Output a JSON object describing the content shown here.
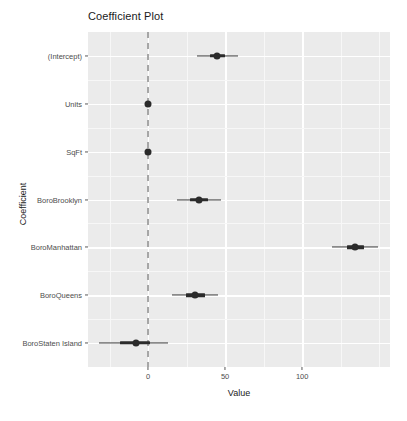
{
  "chart_data": {
    "type": "scatter",
    "title": "Coefficient Plot",
    "xlabel": "Value",
    "ylabel": "Coefficient",
    "xlim": [
      -39,
      157
    ],
    "grid": true,
    "legend": null,
    "xticks": [
      {
        "value": 0,
        "label": "0"
      },
      {
        "value": 50,
        "label": "50"
      },
      {
        "value": 100,
        "label": "100"
      }
    ],
    "x_minor_ticks": [
      -25,
      25,
      75,
      125,
      150
    ],
    "reference_line": {
      "value": 0,
      "style": "dashed",
      "color": "#a6a6a6"
    },
    "categories": [
      "BoroStaten Island",
      "BoroQueens",
      "BoroManhattan",
      "BoroBrooklyn",
      "SqFt",
      "Units",
      "(Intercept)"
    ],
    "points": [
      {
        "label": "BoroStaten Island",
        "estimate": -8.0,
        "inner_low": -18.0,
        "inner_high": 1.5,
        "outer_low": -32.0,
        "outer_high": 13.0
      },
      {
        "label": "BoroQueens",
        "estimate": 30.5,
        "inner_low": 24.5,
        "inner_high": 37.0,
        "outer_low": 15.5,
        "outer_high": 45.5
      },
      {
        "label": "BoroManhattan",
        "estimate": 134.5,
        "inner_low": 129.0,
        "inner_high": 140.0,
        "outer_low": 119.5,
        "outer_high": 149.0
      },
      {
        "label": "BoroBrooklyn",
        "estimate": 33.0,
        "inner_low": 27.5,
        "inner_high": 39.0,
        "outer_low": 18.5,
        "outer_high": 47.5
      },
      {
        "label": "SqFt",
        "estimate": 0.0,
        "inner_low": 0.0,
        "inner_high": 0.0,
        "outer_low": 0.0,
        "outer_high": 0.0
      },
      {
        "label": "Units",
        "estimate": 0.0,
        "inner_low": 0.0,
        "inner_high": 0.0,
        "outer_low": 0.0,
        "outer_high": 0.0
      },
      {
        "label": "(Intercept)",
        "estimate": 45.0,
        "inner_low": 40.0,
        "inner_high": 50.0,
        "outer_low": 31.5,
        "outer_high": 58.5
      }
    ],
    "colors": {
      "panel_background": "#ebebeb",
      "gridline_major": "#ffffff",
      "gridline_minor": "#f7f7f7",
      "point": "#2b2b2b",
      "reference_line": "#a6a6a6",
      "axis_text": "#4d4d4d",
      "title_text": "#1a1a1a"
    }
  }
}
